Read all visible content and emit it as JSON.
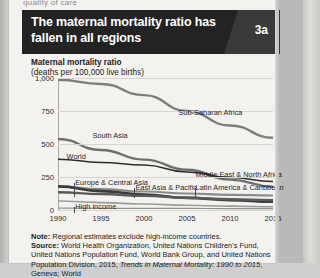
{
  "page": {
    "cut_text_above": "quality of care"
  },
  "figure": {
    "badge": "3a",
    "title": "The maternal mortality ratio has fallen in all regions",
    "axis_title_main": "Maternal mortality ratio",
    "axis_title_sub": "(deaths per 100,000 live births)",
    "note_label": "Note:",
    "note_text": " Regional estimates exclude high-income countries.",
    "source_label": "Source:",
    "source_text": " World Health Organization, United Nations Children's Fund, United Nations Population Fund, World Bank Group, and United Nations Population Division, 2015, ",
    "source_italic": "Trends in Maternal Mortality: 1990 to 2015",
    "source_tail": ", Geneva; World"
  },
  "chart_data": {
    "type": "line",
    "title": "The maternal mortality ratio has fallen in all regions",
    "xlabel": "",
    "ylabel": "Maternal mortality ratio (deaths per 100,000 live births)",
    "xlim": [
      1990,
      2015
    ],
    "ylim": [
      0,
      1000
    ],
    "yticks": [
      "0",
      "250",
      "500",
      "750",
      "1,000"
    ],
    "ytick_values": [
      0,
      250,
      500,
      750,
      1000
    ],
    "xticks": [
      "1990",
      "1995",
      "2000",
      "2005",
      "2010",
      "2015"
    ],
    "xtick_values": [
      1990,
      1995,
      2000,
      2005,
      2010,
      2015
    ],
    "grid": "horizontal",
    "legend": "inline-labels",
    "x": [
      1990,
      1995,
      2000,
      2005,
      2010,
      2015
    ],
    "series": [
      {
        "name": "Sub-Saharan Africa",
        "values": [
          987,
          955,
          870,
          750,
          640,
          547
        ],
        "color": "#7d7d7d",
        "width": 2.4
      },
      {
        "name": "South Asia",
        "values": [
          538,
          455,
          382,
          305,
          230,
          176
        ],
        "color": "#6f6f6f",
        "width": 2.4
      },
      {
        "name": "World",
        "values": [
          385,
          360,
          341,
          288,
          246,
          216
        ],
        "color": "#2b2b2b",
        "width": 1.5
      },
      {
        "name": "Middle East & North Africa",
        "values": [
          177,
          158,
          140,
          125,
          115,
          110
        ],
        "color": "#8a8a8a",
        "width": 2.2
      },
      {
        "name": "Europe & Central Asia",
        "values": [
          68,
          56,
          45,
          36,
          29,
          25
        ],
        "color": "#9a9a9a",
        "width": 1.6
      },
      {
        "name": "East Asia & Pacific",
        "values": [
          179,
          143,
          117,
          92,
          75,
          62
        ],
        "color": "#3a3a3a",
        "width": 2.6
      },
      {
        "name": "Latin America & Caribbean",
        "values": [
          135,
          121,
          107,
          93,
          81,
          74
        ],
        "color": "#5a5a5a",
        "width": 2.4
      },
      {
        "name": "High income",
        "values": [
          14,
          13,
          12,
          12,
          11,
          11
        ],
        "color": "#8f8f8f",
        "width": 1.2
      }
    ],
    "annotations": [
      {
        "label": "Sub-Saharan Africa",
        "x": 2004,
        "y": 735
      },
      {
        "label": "South Asia",
        "x": 1994,
        "y": 560
      },
      {
        "label": "World",
        "x": 1991,
        "y": 400
      },
      {
        "label": "Middle East & North Africa",
        "x": 2006,
        "y": 268
      },
      {
        "label": "Europe & Central Asia",
        "x": 1992,
        "y": 205
      },
      {
        "label": "East Asia & Pacific",
        "x": 1999,
        "y": 168
      },
      {
        "label": "Latin America & Caribbean",
        "x": 2006,
        "y": 168
      },
      {
        "label": "High income",
        "x": 1992,
        "y": 22
      }
    ]
  }
}
